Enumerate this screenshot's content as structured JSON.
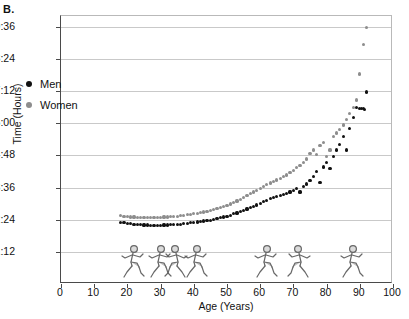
{
  "panel": {
    "label": "B."
  },
  "chart_data": {
    "type": "scatter",
    "title": "",
    "xlabel": "Age (Years)",
    "ylabel": "Time (Hours)",
    "xlim": [
      0,
      100
    ],
    "ylim": [
      0,
      600
    ],
    "grid": true,
    "legend_position": "upper-left-inside",
    "y_tick_values": [
      72,
      144,
      216,
      288,
      360,
      432,
      504,
      576
    ],
    "y_tick_labels": [
      "1:12",
      "2:24",
      "3:36",
      "4:48",
      "6:00",
      "7:12",
      "8:24",
      "9:36"
    ],
    "x_ticks": [
      0,
      10,
      20,
      30,
      40,
      50,
      60,
      70,
      80,
      90,
      100
    ],
    "x_tick_labels": [
      "0",
      "10",
      "20",
      "30",
      "40",
      "50",
      "60",
      "70",
      "80",
      "90",
      "100"
    ],
    "y_unit_note": "minutes (displayed as H:MM)",
    "series": [
      {
        "name": "Men",
        "color": "#111111",
        "points": [
          [
            18,
            138
          ],
          [
            19,
            137
          ],
          [
            20,
            136
          ],
          [
            21,
            135
          ],
          [
            22,
            134
          ],
          [
            23,
            133
          ],
          [
            24,
            133
          ],
          [
            25,
            132
          ],
          [
            26,
            132
          ],
          [
            27,
            131
          ],
          [
            28,
            131
          ],
          [
            29,
            131
          ],
          [
            30,
            131
          ],
          [
            31,
            132
          ],
          [
            32,
            132
          ],
          [
            33,
            133
          ],
          [
            34,
            133
          ],
          [
            35,
            134
          ],
          [
            36,
            134
          ],
          [
            37,
            135
          ],
          [
            38,
            136
          ],
          [
            39,
            137
          ],
          [
            40,
            138
          ],
          [
            41,
            139
          ],
          [
            42,
            140
          ],
          [
            43,
            141
          ],
          [
            44,
            142
          ],
          [
            45,
            143
          ],
          [
            46,
            145
          ],
          [
            47,
            146
          ],
          [
            48,
            148
          ],
          [
            49,
            150
          ],
          [
            50,
            152
          ],
          [
            51,
            154
          ],
          [
            52,
            157
          ],
          [
            53,
            159
          ],
          [
            54,
            162
          ],
          [
            55,
            165
          ],
          [
            56,
            168
          ],
          [
            57,
            171
          ],
          [
            58,
            174
          ],
          [
            59,
            177
          ],
          [
            60,
            180
          ],
          [
            61,
            184
          ],
          [
            62,
            187
          ],
          [
            63,
            191
          ],
          [
            64,
            194
          ],
          [
            65,
            196
          ],
          [
            66,
            198
          ],
          [
            67,
            200
          ],
          [
            68,
            203
          ],
          [
            69,
            206
          ],
          [
            70,
            210
          ],
          [
            71,
            214
          ],
          [
            72,
            206
          ],
          [
            73,
            218
          ],
          [
            74,
            224
          ],
          [
            75,
            232
          ],
          [
            76,
            240
          ],
          [
            77,
            252
          ],
          [
            78,
            228
          ],
          [
            79,
            262
          ],
          [
            80,
            272
          ],
          [
            81,
            258
          ],
          [
            82,
            286
          ],
          [
            83,
            300
          ],
          [
            84,
            312
          ],
          [
            85,
            330
          ],
          [
            86,
            300
          ],
          [
            87,
            348
          ],
          [
            88,
            372
          ],
          [
            89,
            396
          ],
          [
            90,
            393
          ],
          [
            90.5,
            392
          ],
          [
            91,
            392
          ],
          [
            91.5,
            391
          ],
          [
            92,
            430
          ]
        ]
      },
      {
        "name": "Women",
        "color": "#8d8d8d",
        "points": [
          [
            18,
            153
          ],
          [
            19,
            152
          ],
          [
            20,
            151
          ],
          [
            21,
            150
          ],
          [
            22,
            150
          ],
          [
            23,
            149
          ],
          [
            24,
            149
          ],
          [
            25,
            148
          ],
          [
            26,
            148
          ],
          [
            27,
            148
          ],
          [
            28,
            148
          ],
          [
            29,
            149
          ],
          [
            30,
            149
          ],
          [
            31,
            150
          ],
          [
            32,
            150
          ],
          [
            33,
            151
          ],
          [
            34,
            151
          ],
          [
            35,
            152
          ],
          [
            36,
            153
          ],
          [
            37,
            154
          ],
          [
            38,
            155
          ],
          [
            39,
            156
          ],
          [
            40,
            157
          ],
          [
            41,
            158
          ],
          [
            42,
            160
          ],
          [
            43,
            161
          ],
          [
            44,
            163
          ],
          [
            45,
            165
          ],
          [
            46,
            167
          ],
          [
            47,
            169
          ],
          [
            48,
            171
          ],
          [
            49,
            173
          ],
          [
            50,
            176
          ],
          [
            51,
            179
          ],
          [
            52,
            182
          ],
          [
            53,
            186
          ],
          [
            54,
            190
          ],
          [
            55,
            194
          ],
          [
            56,
            198
          ],
          [
            57,
            202
          ],
          [
            58,
            206
          ],
          [
            59,
            210
          ],
          [
            60,
            214
          ],
          [
            61,
            218
          ],
          [
            62,
            222
          ],
          [
            63,
            226
          ],
          [
            64,
            230
          ],
          [
            65,
            233
          ],
          [
            66,
            236
          ],
          [
            67,
            240
          ],
          [
            68,
            244
          ],
          [
            69,
            249
          ],
          [
            70,
            254
          ],
          [
            71,
            260
          ],
          [
            72,
            266
          ],
          [
            73,
            272
          ],
          [
            74,
            280
          ],
          [
            75,
            292
          ],
          [
            76,
            300
          ],
          [
            77,
            290
          ],
          [
            78,
            310
          ],
          [
            79,
            316
          ],
          [
            80,
            286
          ],
          [
            81,
            300
          ],
          [
            82,
            330
          ],
          [
            83,
            338
          ],
          [
            84,
            346
          ],
          [
            85,
            356
          ],
          [
            86,
            368
          ],
          [
            87,
            382
          ],
          [
            88,
            396
          ],
          [
            89,
            412
          ],
          [
            90,
            470
          ],
          [
            91,
            536
          ],
          [
            92,
            574
          ]
        ]
      }
    ],
    "annotations": [
      "Men are consistently faster than women at every age",
      "Times are flattest between ages 25 and 40",
      "Times rise steeply after age 75"
    ]
  },
  "legend": {
    "items": [
      {
        "label": "Men",
        "color": "#111111"
      },
      {
        "label": "Women",
        "color": "#8d8d8d"
      }
    ]
  },
  "decorations": {
    "runners": [
      {
        "name": "runner-woman-young",
        "age": 22
      },
      {
        "name": "runner-man-adult",
        "age": 30
      },
      {
        "name": "runner-man-athlete",
        "age": 35
      },
      {
        "name": "runner-woman-adult",
        "age": 41
      },
      {
        "name": "runner-man-middleaged",
        "age": 62
      },
      {
        "name": "runner-man-senior",
        "age": 72
      },
      {
        "name": "runner-man-elderly",
        "age": 88
      }
    ]
  }
}
